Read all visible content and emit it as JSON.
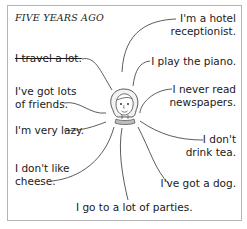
{
  "title": "FIVE YEARS AGO",
  "statements": [
    {
      "id": "travel",
      "text": "I travel a lot.",
      "crossed_out": true
    },
    {
      "id": "friends",
      "line1": "I've got lots",
      "line2": "of friends."
    },
    {
      "id": "lazy",
      "text": "I'm very lazy."
    },
    {
      "id": "cheese",
      "line1": "I don't like",
      "line2": "cheese."
    },
    {
      "id": "parties",
      "text": "I go to a lot of parties."
    },
    {
      "id": "hotel",
      "line1": "I'm a hotel",
      "line2": "receptionist."
    },
    {
      "id": "piano",
      "text": "I play the piano."
    },
    {
      "id": "newspapers",
      "line1": "I never read",
      "line2": "newspapers."
    },
    {
      "id": "tea",
      "line1": "I don't",
      "line2": "drink tea."
    },
    {
      "id": "dog",
      "text": "I've got a dog."
    }
  ]
}
